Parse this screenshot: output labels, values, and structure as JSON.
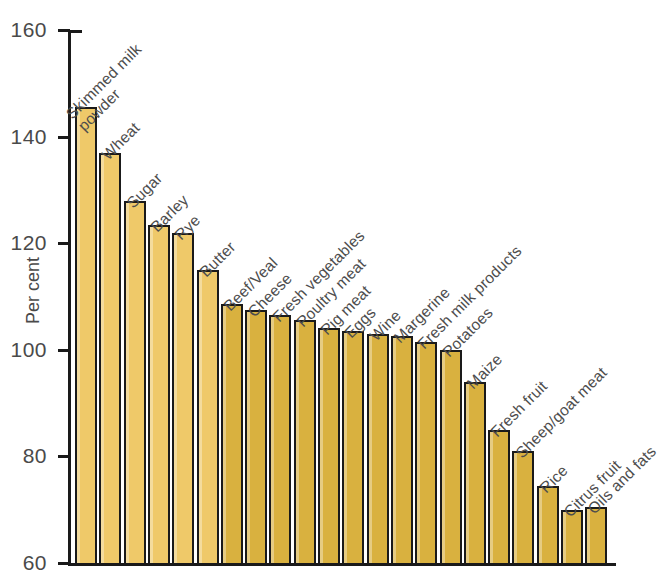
{
  "chart_data": {
    "type": "bar",
    "title": "",
    "subtitle": "",
    "xlabel": "",
    "ylabel": "Per cent",
    "ylim": [
      60,
      160
    ],
    "yticks": [
      60,
      80,
      100,
      120,
      140,
      160
    ],
    "ytick_labels": [
      "60",
      "80",
      "100",
      "120",
      "140",
      "160"
    ],
    "grid": false,
    "legend": null,
    "bar_color": "#efc969",
    "bar_color_secondary": "#d9b13f",
    "bar_outline_color": "#1a1a1a",
    "categories": [
      "Skimmed milk\npowder",
      "Wheat",
      "Sugar",
      "Barley",
      "Rye",
      "Butter",
      "Beef/Veal",
      "Cheese",
      "Fresh vegetables",
      "Poultry meat",
      "Pig meat",
      "Eggs",
      "Wine",
      "Margerine",
      "Fresh milk products",
      "Potatoes",
      "Maize",
      "Fresh fruit",
      "Sheep/goat meat",
      "Rice",
      "Citrus fruit",
      "Oils and fats"
    ],
    "values": [
      145.5,
      137.0,
      128.0,
      123.5,
      122.0,
      115.0,
      108.5,
      107.5,
      106.5,
      105.5,
      104.0,
      103.5,
      103.0,
      102.5,
      101.5,
      100.0,
      94.0,
      85.0,
      81.0,
      74.5,
      70.0,
      70.5
    ],
    "value_unit": "per cent"
  },
  "axis": {
    "y_title": "Per cent"
  }
}
